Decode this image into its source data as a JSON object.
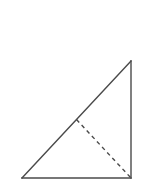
{
  "figure": {
    "background_color": "#ffffff",
    "canvas": {
      "width": 148,
      "height": 195
    },
    "stroke_color": "#4a4a4a",
    "stroke_width": 1.4,
    "dashed_stroke_color": "#4a4a4a",
    "dashed_stroke_width": 1.4,
    "dash_pattern": "4,3.5",
    "vertices": {
      "bottom_left": {
        "label": "",
        "x": 22,
        "y": 178
      },
      "bottom_right": {
        "label": "",
        "x": 131,
        "y": 178
      },
      "top_right": {
        "label": "",
        "x": 131,
        "y": 61
      },
      "hypotenuse_midpoint": {
        "label": "",
        "x": 76.5,
        "y": 119.5
      }
    },
    "edges": [
      {
        "name": "base",
        "style": "solid",
        "from": "bottom_left",
        "to": "bottom_right"
      },
      {
        "name": "vertical-leg",
        "style": "solid",
        "from": "bottom_right",
        "to": "top_right"
      },
      {
        "name": "hypotenuse",
        "style": "solid",
        "from": "top_right",
        "to": "bottom_left"
      },
      {
        "name": "median",
        "style": "dashed",
        "from": "hypotenuse_midpoint",
        "to": "bottom_right"
      }
    ],
    "labels": []
  }
}
